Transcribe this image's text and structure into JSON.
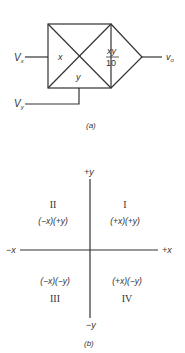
{
  "figure_a": {
    "caption": "(a)",
    "inputs": {
      "vx_label": "V",
      "vx_sub": "x",
      "vy_label": "V",
      "vy_sub": "y"
    },
    "box_labels": {
      "x": "x",
      "y": "y",
      "numerator": "xy",
      "denominator": "10"
    },
    "output": {
      "label": "v",
      "sub": "o"
    }
  },
  "figure_b": {
    "caption": "(b)",
    "axes": {
      "pos_y": "+y",
      "neg_y": "−y",
      "pos_x": "+x",
      "neg_x": "−x"
    },
    "quadrants": [
      {
        "numeral": "I",
        "signs": "(+x)(+y)"
      },
      {
        "numeral": "II",
        "signs": "(−x)(+y)"
      },
      {
        "numeral": "III",
        "signs": "(−x)(−y)"
      },
      {
        "numeral": "IV",
        "signs": "(+x)(−y)"
      }
    ]
  }
}
